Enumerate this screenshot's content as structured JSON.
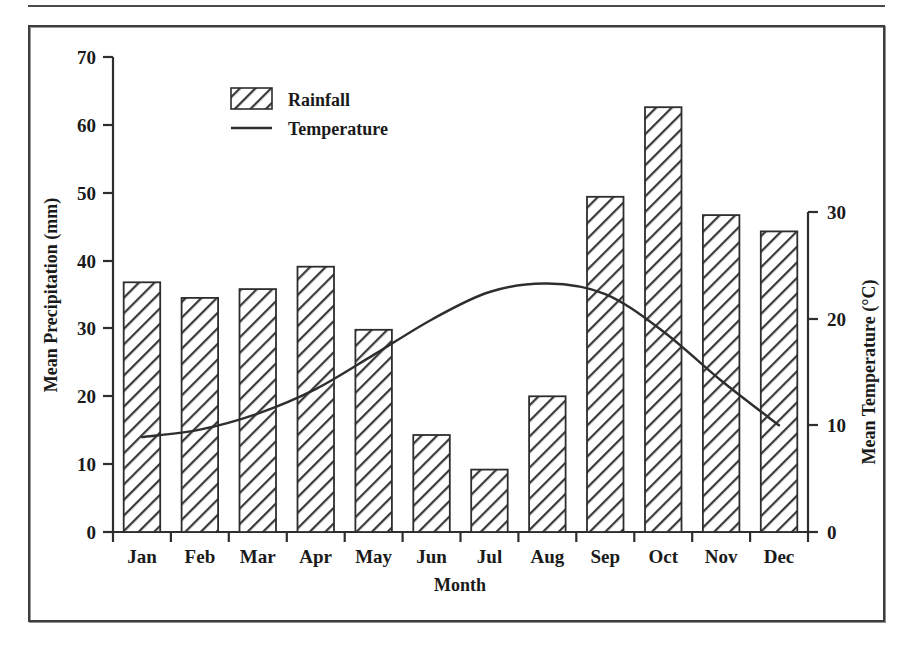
{
  "figure": {
    "frame_color": "#3d3d3d",
    "background": "#ffffff",
    "ink_color": "#1a1a1a"
  },
  "legend": {
    "position": "top-left-inside",
    "entries": [
      {
        "key": "rainfall",
        "label": "Rainfall",
        "marker": "hatched-swatch"
      },
      {
        "key": "temperature",
        "label": "Temperature",
        "marker": "line-swatch"
      }
    ]
  },
  "axes": {
    "x": {
      "title": "Month",
      "ticks": [
        "Jan",
        "Feb",
        "Mar",
        "Apr",
        "May",
        "Jun",
        "Jul",
        "Aug",
        "Sep",
        "Oct",
        "Nov",
        "Dec"
      ]
    },
    "y_left": {
      "title": "Mean Precipitation (mm)",
      "ticks": [
        "0",
        "10",
        "20",
        "30",
        "40",
        "50",
        "60",
        "70"
      ],
      "min": 0,
      "max": 70
    },
    "y_right": {
      "title": "Mean Temperature (°C)",
      "ticks": [
        "0",
        "10",
        "20",
        "30"
      ],
      "min": 0,
      "max": 30
    }
  },
  "chart_data": {
    "type": "bar",
    "title": "",
    "subtitle": "",
    "xlabel": "Month",
    "ylabel": "Mean Precipitation (mm)",
    "y2label": "Mean Temperature (°C)",
    "categories": [
      "Jan",
      "Feb",
      "Mar",
      "Apr",
      "May",
      "Jun",
      "Jul",
      "Aug",
      "Sep",
      "Oct",
      "Nov",
      "Dec"
    ],
    "ylim": [
      0,
      70
    ],
    "y2lim": [
      0,
      30
    ],
    "yticks": [
      0,
      10,
      20,
      30,
      40,
      50,
      60,
      70
    ],
    "y2ticks": [
      0,
      10,
      20,
      30
    ],
    "grid": false,
    "legend_position": "upper left",
    "series": [
      {
        "name": "Rainfall",
        "type": "bar",
        "axis": "left",
        "unit": "mm",
        "fill": "diagonal-hatch",
        "values": [
          36.8,
          34.5,
          35.8,
          39.1,
          29.8,
          14.3,
          9.2,
          20.0,
          49.4,
          62.6,
          46.7,
          44.3
        ]
      },
      {
        "name": "Temperature",
        "type": "line",
        "axis": "right",
        "unit": "°C",
        "values": [
          8.9,
          9.6,
          11.1,
          13.4,
          16.6,
          19.9,
          22.5,
          23.3,
          22.3,
          18.8,
          14.2,
          10.0
        ]
      }
    ]
  }
}
